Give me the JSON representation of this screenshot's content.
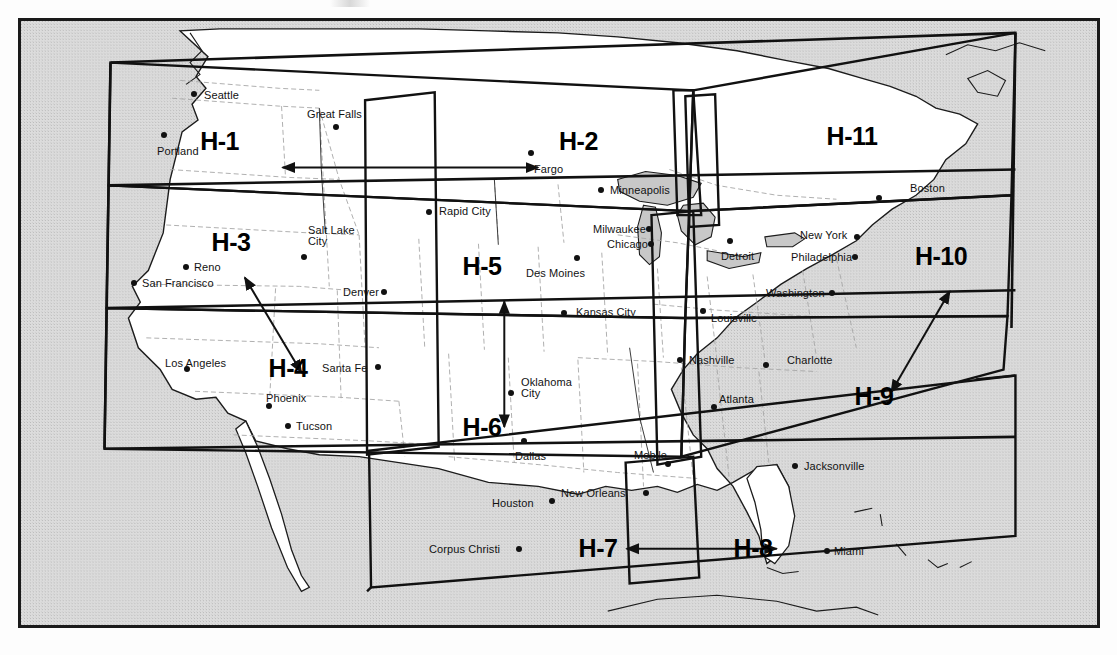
{
  "map": {
    "title": "HIRS Sounding Region Map (H-1 .. H-11)",
    "frame_color": "#1a1a1a",
    "ocean_color": "#d9d9d9",
    "land_color": "#ffffff",
    "lake_color": "#c9c9c9",
    "state_border_color": "#9a9a9a",
    "region_border_color": "#111111"
  },
  "regions": [
    {
      "id": "H-1",
      "label": "H-1",
      "x": 238,
      "y": 142,
      "anchor": "right"
    },
    {
      "id": "H-2",
      "label": "H-2",
      "x": 558,
      "y": 142,
      "anchor": "left"
    },
    {
      "id": "H-3",
      "label": "H-3",
      "x": 230,
      "y": 243,
      "anchor": "center"
    },
    {
      "id": "H-4",
      "label": "H-4",
      "x": 287,
      "y": 369,
      "anchor": "center"
    },
    {
      "id": "H-5",
      "label": "H-5",
      "x": 481,
      "y": 267,
      "anchor": "center"
    },
    {
      "id": "H-6",
      "label": "H-6",
      "x": 481,
      "y": 428,
      "anchor": "center"
    },
    {
      "id": "H-7",
      "label": "H-7",
      "x": 597,
      "y": 549,
      "anchor": "center"
    },
    {
      "id": "H-8",
      "label": "H-8",
      "x": 752,
      "y": 549,
      "anchor": "center"
    },
    {
      "id": "H-9",
      "label": "H-9",
      "x": 873,
      "y": 397,
      "anchor": "center"
    },
    {
      "id": "H-10",
      "label": "H-10",
      "x": 940,
      "y": 257,
      "anchor": "center"
    },
    {
      "id": "H-11",
      "label": "H-11",
      "x": 851,
      "y": 137,
      "anchor": "center"
    }
  ],
  "arrows": [
    {
      "name": "arrow-h1-h2",
      "kind": "double",
      "x1": 263,
      "y1": 148,
      "x2": 520,
      "y2": 148
    },
    {
      "name": "arrow-h3-h4",
      "kind": "double",
      "x1": 225,
      "y1": 259,
      "x2": 282,
      "y2": 355
    },
    {
      "name": "arrow-h5-h6",
      "kind": "double",
      "x1": 486,
      "y1": 283,
      "x2": 486,
      "y2": 410
    },
    {
      "name": "arrow-h7-h8",
      "kind": "double",
      "x1": 609,
      "y1": 533,
      "x2": 760,
      "y2": 533
    },
    {
      "name": "arrow-h9-h10",
      "kind": "double",
      "x1": 875,
      "y1": 375,
      "x2": 934,
      "y2": 273
    }
  ],
  "cities": [
    {
      "name": "Seattle",
      "dot_x": 193,
      "dot_y": 93,
      "lx": 203,
      "ly": 89,
      "anchor": "left"
    },
    {
      "name": "Portland",
      "dot_x": 163,
      "dot_y": 134,
      "lx": 156,
      "ly": 145,
      "anchor": "left"
    },
    {
      "name": "Great Falls",
      "dot_x": 335,
      "dot_y": 126,
      "lx": 306,
      "ly": 108,
      "anchor": "left"
    },
    {
      "name": "Fargo",
      "dot_x": 530,
      "dot_y": 152,
      "lx": 533,
      "ly": 163,
      "anchor": "left"
    },
    {
      "name": "Minneapolis",
      "dot_x": 600,
      "dot_y": 189,
      "lx": 609,
      "ly": 184,
      "anchor": "left"
    },
    {
      "name": "Rapid City",
      "dot_x": 428,
      "dot_y": 211,
      "lx": 438,
      "ly": 205,
      "anchor": "left"
    },
    {
      "name": "Salt Lake\nCity",
      "dot_x": 303,
      "dot_y": 256,
      "lx": 307,
      "ly": 224,
      "anchor": "left"
    },
    {
      "name": "Reno",
      "dot_x": 185,
      "dot_y": 266,
      "lx": 193,
      "ly": 261,
      "anchor": "left"
    },
    {
      "name": "San Francisco",
      "dot_x": 133,
      "dot_y": 282,
      "lx": 141,
      "ly": 277,
      "anchor": "left"
    },
    {
      "name": "Denver",
      "dot_x": 383,
      "dot_y": 291,
      "lx": 342,
      "ly": 286,
      "anchor": "left"
    },
    {
      "name": "Milwaukee",
      "dot_x": 648,
      "dot_y": 228,
      "lx": 592,
      "ly": 223,
      "anchor": "left"
    },
    {
      "name": "Chicago",
      "dot_x": 650,
      "dot_y": 243,
      "lx": 606,
      "ly": 238,
      "anchor": "left"
    },
    {
      "name": "Des Moines",
      "dot_x": 576,
      "dot_y": 257,
      "lx": 525,
      "ly": 267,
      "anchor": "left"
    },
    {
      "name": "Kansas City",
      "dot_x": 563,
      "dot_y": 312,
      "lx": 575,
      "ly": 306,
      "anchor": "left"
    },
    {
      "name": "Detroit",
      "dot_x": 729,
      "dot_y": 240,
      "lx": 720,
      "ly": 250,
      "anchor": "left"
    },
    {
      "name": "New York",
      "dot_x": 856,
      "dot_y": 236,
      "lx": 799,
      "ly": 229,
      "anchor": "left"
    },
    {
      "name": "Philadelphia",
      "dot_x": 854,
      "dot_y": 256,
      "lx": 790,
      "ly": 251,
      "anchor": "left"
    },
    {
      "name": "Washington",
      "dot_x": 831,
      "dot_y": 292,
      "lx": 765,
      "ly": 287,
      "anchor": "left"
    },
    {
      "name": "Boston",
      "dot_x": 878,
      "dot_y": 197,
      "lx": 909,
      "ly": 182,
      "anchor": "left"
    },
    {
      "name": "Louisville",
      "dot_x": 702,
      "dot_y": 310,
      "lx": 710,
      "ly": 312,
      "anchor": "left"
    },
    {
      "name": "Los Angeles",
      "dot_x": 186,
      "dot_y": 368,
      "lx": 164,
      "ly": 357,
      "anchor": "left"
    },
    {
      "name": "Santa Fe",
      "dot_x": 377,
      "dot_y": 366,
      "lx": 321,
      "ly": 362,
      "anchor": "left"
    },
    {
      "name": "Phoenix",
      "dot_x": 268,
      "dot_y": 405,
      "lx": 265,
      "ly": 392,
      "anchor": "left"
    },
    {
      "name": "Tucson",
      "dot_x": 287,
      "dot_y": 425,
      "lx": 295,
      "ly": 420,
      "anchor": "left"
    },
    {
      "name": "Oklahoma\nCity",
      "dot_x": 510,
      "dot_y": 392,
      "lx": 520,
      "ly": 376,
      "anchor": "left"
    },
    {
      "name": "Dallas",
      "dot_x": 523,
      "dot_y": 440,
      "lx": 514,
      "ly": 450,
      "anchor": "left"
    },
    {
      "name": "Nashville",
      "dot_x": 679,
      "dot_y": 359,
      "lx": 688,
      "ly": 354,
      "anchor": "left"
    },
    {
      "name": "Charlotte",
      "dot_x": 765,
      "dot_y": 364,
      "lx": 786,
      "ly": 354,
      "anchor": "left"
    },
    {
      "name": "Atlanta",
      "dot_x": 713,
      "dot_y": 406,
      "lx": 718,
      "ly": 393,
      "anchor": "left"
    },
    {
      "name": "Mobile",
      "dot_x": 667,
      "dot_y": 463,
      "lx": 633,
      "ly": 449,
      "anchor": "left"
    },
    {
      "name": "Jacksonville",
      "dot_x": 794,
      "dot_y": 465,
      "lx": 803,
      "ly": 460,
      "anchor": "left"
    },
    {
      "name": "New Orleans",
      "dot_x": 645,
      "dot_y": 492,
      "lx": 560,
      "ly": 487,
      "anchor": "left"
    },
    {
      "name": "Houston",
      "dot_x": 551,
      "dot_y": 500,
      "lx": 491,
      "ly": 497,
      "anchor": "left"
    },
    {
      "name": "Corpus Christi",
      "dot_x": 518,
      "dot_y": 548,
      "lx": 428,
      "ly": 543,
      "anchor": "left"
    },
    {
      "name": "Miami",
      "dot_x": 826,
      "dot_y": 550,
      "lx": 833,
      "ly": 545,
      "anchor": "left"
    }
  ]
}
